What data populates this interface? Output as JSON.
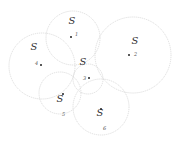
{
  "diagram": {
    "colors": {
      "circle_stroke": "#d6d6d6",
      "label": "#333333",
      "dot": "#222222"
    },
    "nodes": [
      {
        "id": "1",
        "s_label": "S",
        "num_label": "1",
        "circle": {
          "cx": 73,
          "cy": 38,
          "r": 27
        },
        "s_pos": {
          "x": 72,
          "y": 24
        },
        "dot": {
          "x": 71,
          "y": 37
        },
        "num_pos": {
          "x": 75,
          "y": 36
        }
      },
      {
        "id": "2",
        "s_label": "S",
        "num_label": "2",
        "circle": {
          "cx": 133,
          "cy": 55,
          "r": 38
        },
        "s_pos": {
          "x": 135,
          "y": 44
        },
        "dot": {
          "x": 129,
          "y": 55
        },
        "num_pos": {
          "x": 134,
          "y": 56
        }
      },
      {
        "id": "3",
        "s_label": "S",
        "num_label": "3",
        "circle": {
          "cx": 88,
          "cy": 79,
          "r": 15
        },
        "s_pos": {
          "x": 83,
          "y": 65
        },
        "dot": {
          "x": 89,
          "y": 78
        },
        "num_pos": {
          "x": 83,
          "y": 80
        }
      },
      {
        "id": "4",
        "s_label": "S",
        "num_label": "4",
        "circle": {
          "cx": 42,
          "cy": 66,
          "r": 33
        },
        "s_pos": {
          "x": 34,
          "y": 50
        },
        "dot": {
          "x": 41,
          "y": 65
        },
        "num_pos": {
          "x": 35,
          "y": 65
        }
      },
      {
        "id": "5",
        "s_label": "S",
        "num_label": "5",
        "circle": {
          "cx": 60,
          "cy": 93,
          "r": 21
        },
        "s_pos": {
          "x": 60,
          "y": 102
        },
        "dot": {
          "x": 63,
          "y": 94
        },
        "num_pos": {
          "x": 62,
          "y": 116
        }
      },
      {
        "id": "6",
        "s_label": "S",
        "num_label": "6",
        "circle": {
          "cx": 101,
          "cy": 107,
          "r": 28
        },
        "s_pos": {
          "x": 100,
          "y": 116
        },
        "dot": {
          "x": 101,
          "y": 109
        },
        "num_pos": {
          "x": 103,
          "y": 130
        }
      }
    ]
  }
}
